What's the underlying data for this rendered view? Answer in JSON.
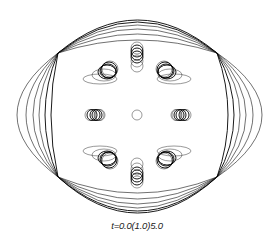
{
  "figure": {
    "caption": "t=0.0(1.0)5.0",
    "center": [
      137,
      115
    ],
    "outer_boundary": {
      "cusps": [
        [
          58,
          53
        ],
        [
          217,
          53
        ],
        [
          58,
          177
        ],
        [
          217,
          177
        ]
      ],
      "top_arcs_peak_y": [
        20,
        22,
        25,
        29,
        34,
        40
      ],
      "bottom_arcs_trough_y": [
        213,
        211,
        208,
        204,
        199,
        193
      ],
      "left_arcs_extreme_x": [
        17,
        26,
        33,
        39,
        45,
        51
      ],
      "right_arcs_extreme_x": [
        262,
        253,
        246,
        240,
        234,
        228
      ]
    },
    "inclusions": [
      {
        "name": "top",
        "cx": [
          137,
          137,
          137,
          137,
          137,
          137
        ],
        "cy": [
          48,
          51,
          54,
          57,
          61,
          66
        ],
        "rx": [
          6,
          6,
          6,
          6,
          6,
          6
        ],
        "ry": [
          6,
          6,
          6,
          6,
          6,
          6
        ]
      },
      {
        "name": "bottom",
        "cx": [
          137,
          137,
          137,
          137,
          137,
          137
        ],
        "cy": [
          182,
          179,
          176,
          173,
          169,
          164
        ],
        "rx": [
          6,
          6,
          6,
          6,
          6,
          6
        ],
        "ry": [
          6,
          6,
          6,
          6,
          6,
          6
        ]
      },
      {
        "name": "upper-left",
        "cx": [
          110,
          109,
          108,
          107,
          104,
          100
        ],
        "cy": [
          69,
          70,
          71,
          72,
          75,
          79
        ],
        "rx": [
          8,
          8,
          8,
          9,
          12,
          17
        ],
        "ry": [
          8,
          8,
          7,
          7,
          6,
          5
        ]
      },
      {
        "name": "upper-right",
        "cx": [
          164,
          165,
          166,
          167,
          170,
          174
        ],
        "cy": [
          69,
          70,
          71,
          72,
          75,
          79
        ],
        "rx": [
          8,
          8,
          8,
          9,
          12,
          17
        ],
        "ry": [
          8,
          8,
          7,
          7,
          6,
          5
        ]
      },
      {
        "name": "lower-left",
        "cx": [
          110,
          109,
          108,
          107,
          104,
          100
        ],
        "cy": [
          161,
          160,
          159,
          158,
          155,
          151
        ],
        "rx": [
          8,
          8,
          8,
          9,
          12,
          17
        ],
        "ry": [
          8,
          8,
          7,
          7,
          6,
          5
        ]
      },
      {
        "name": "lower-right",
        "cx": [
          164,
          165,
          166,
          167,
          170,
          174
        ],
        "cy": [
          161,
          160,
          159,
          158,
          155,
          151
        ],
        "rx": [
          8,
          8,
          8,
          9,
          12,
          17
        ],
        "ry": [
          8,
          8,
          7,
          7,
          6,
          5
        ]
      },
      {
        "name": "left",
        "cx": [
          90,
          92,
          95,
          97,
          99,
          100
        ],
        "cy": [
          115,
          115,
          115,
          115,
          115,
          115
        ],
        "rx": [
          5,
          5,
          5,
          5,
          5,
          5
        ],
        "ry": [
          5.5,
          5.5,
          5.5,
          5.5,
          5.5,
          5.5
        ]
      },
      {
        "name": "right",
        "cx": [
          186,
          184,
          181,
          179,
          177,
          176
        ],
        "cy": [
          115,
          115,
          115,
          115,
          115,
          115
        ],
        "rx": [
          5,
          5,
          5,
          5,
          5,
          5
        ],
        "ry": [
          5.5,
          5.5,
          5.5,
          5.5,
          5.5,
          5.5
        ]
      },
      {
        "name": "center",
        "cx": [
          137
        ],
        "cy": [
          115
        ],
        "rx": [
          5
        ],
        "ry": [
          5
        ]
      }
    ],
    "colors": {
      "stroke": "#111111",
      "background": "#ffffff",
      "caption": "#222222"
    }
  }
}
